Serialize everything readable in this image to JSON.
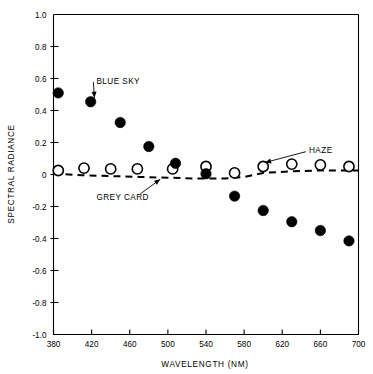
{
  "chart_data": {
    "type": "scatter",
    "title": "",
    "xlabel": "WAVELENGTH (NM)",
    "ylabel": "SPECTRAL RADIANCE",
    "xlim": [
      380,
      700
    ],
    "ylim": [
      -1.0,
      1.0
    ],
    "xticks": [
      380,
      420,
      460,
      500,
      540,
      580,
      620,
      660,
      700
    ],
    "xtick_labels": [
      "380",
      "420",
      "460",
      "500",
      "540",
      "580",
      "620",
      "660",
      "700"
    ],
    "yticks": [
      1.0,
      0.8,
      0.6,
      0.4,
      0.2,
      0,
      -0.2,
      -0.4,
      -0.6,
      -0.8,
      -1.0
    ],
    "ytick_labels": [
      "1.0",
      "0.8",
      "0.6",
      "0.4",
      "0.2",
      "0",
      "-0.2",
      "-0.4",
      "-0.6",
      "-0.8",
      "-1.0"
    ],
    "grid": false,
    "legend_position": "inline-annotations",
    "series": [
      {
        "name": "BLUE SKY",
        "marker": "filled-circle",
        "color": "#000000",
        "x": [
          385,
          419,
          450,
          480,
          508,
          540,
          570,
          600,
          630,
          660,
          690
        ],
        "y": [
          0.51,
          0.455,
          0.325,
          0.175,
          0.07,
          0.005,
          -0.135,
          -0.225,
          -0.295,
          -0.35,
          -0.415
        ]
      },
      {
        "name": "HAZE",
        "marker": "open-circle",
        "color": "#000000",
        "x": [
          385,
          412,
          440,
          468,
          505,
          540,
          570,
          600,
          630,
          660,
          690
        ],
        "y": [
          0.025,
          0.04,
          0.035,
          0.035,
          0.035,
          0.05,
          0.01,
          0.05,
          0.065,
          0.06,
          0.05
        ]
      },
      {
        "name": "GREY CARD",
        "marker": "dashed-line",
        "color": "#000000",
        "x": [
          380,
          410,
          440,
          470,
          500,
          530,
          560,
          580,
          600,
          630,
          660,
          700
        ],
        "y": [
          0.005,
          -0.005,
          -0.01,
          -0.015,
          -0.02,
          -0.025,
          -0.025,
          -0.015,
          0.01,
          0.02,
          0.025,
          0.025
        ]
      }
    ],
    "annotations": [
      {
        "label": "BLUE SKY",
        "text_x": 425,
        "text_y": 0.585,
        "arrow_to_x": 423,
        "arrow_to_y": 0.48
      },
      {
        "label": "HAZE",
        "text_x": 648,
        "text_y": 0.155,
        "arrow_to_x": 602,
        "arrow_to_y": 0.075
      },
      {
        "label": "GREY CARD",
        "text_x": 425,
        "text_y": -0.14,
        "arrow_to_x": 492,
        "arrow_to_y": -0.03
      }
    ]
  }
}
